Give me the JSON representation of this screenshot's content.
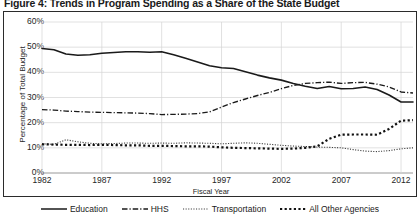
{
  "chart_data": {
    "type": "line",
    "title": "Figure 4: Trends in Program Spending as a Share of the State Budget",
    "xlabel": "Fiscal Year",
    "ylabel": "Percentage of Total Budget",
    "ylim": [
      0,
      60
    ],
    "xlim": [
      1982,
      2013
    ],
    "ytick_labels": [
      "0%",
      "10%",
      "20%",
      "30%",
      "40%",
      "50%",
      "60%"
    ],
    "ytick_values": [
      0,
      10,
      20,
      30,
      40,
      50,
      60
    ],
    "xtick_labels": [
      "1982",
      "1987",
      "1992",
      "1997",
      "2002",
      "2007",
      "2012"
    ],
    "xtick_values": [
      1982,
      1987,
      1992,
      1997,
      2002,
      2007,
      2012
    ],
    "grid": true,
    "legend_position": "bottom",
    "x": [
      1982,
      1983,
      1984,
      1985,
      1986,
      1987,
      1988,
      1989,
      1990,
      1991,
      1992,
      1993,
      1994,
      1995,
      1996,
      1997,
      1998,
      1999,
      2000,
      2001,
      2002,
      2003,
      2004,
      2005,
      2006,
      2007,
      2008,
      2009,
      2010,
      2011,
      2012,
      2013
    ],
    "series": [
      {
        "name": "Education",
        "style": "solid",
        "color": "#1a1a1a",
        "values": [
          49.5,
          49.0,
          47.3,
          46.8,
          47.0,
          47.6,
          47.9,
          48.2,
          48.2,
          48.0,
          48.2,
          47.0,
          45.6,
          44.1,
          42.6,
          41.8,
          41.5,
          40.2,
          38.9,
          37.8,
          36.9,
          35.6,
          34.5,
          33.6,
          34.4,
          33.5,
          33.6,
          34.2,
          33.2,
          31.0,
          28.2,
          28.2
        ]
      },
      {
        "name": "HHS",
        "style": "dashdot",
        "color": "#1a1a1a",
        "values": [
          25.2,
          25.0,
          24.6,
          24.4,
          24.2,
          24.1,
          24.0,
          23.9,
          23.8,
          23.6,
          23.2,
          23.3,
          23.4,
          23.6,
          24.3,
          26.2,
          28.0,
          29.4,
          30.8,
          32.0,
          33.5,
          34.8,
          35.6,
          35.9,
          36.1,
          35.6,
          35.9,
          36.0,
          35.3,
          34.2,
          32.2,
          31.8
        ]
      },
      {
        "name": "Transportation",
        "style": "dotted-fine",
        "color": "#3a3a3a",
        "values": [
          11.6,
          11.4,
          13.2,
          12.4,
          11.8,
          11.6,
          11.7,
          11.9,
          11.9,
          11.8,
          11.9,
          11.8,
          12.0,
          11.9,
          11.8,
          11.6,
          11.8,
          12.0,
          11.8,
          11.4,
          11.0,
          10.7,
          10.5,
          10.3,
          10.2,
          10.0,
          9.3,
          8.7,
          8.5,
          8.9,
          9.6,
          10.0
        ]
      },
      {
        "name": "All Other Agencies",
        "style": "dotted-bold",
        "color": "#111111",
        "values": [
          11.4,
          11.3,
          11.2,
          11.2,
          11.1,
          11.2,
          11.1,
          11.0,
          11.0,
          10.8,
          10.8,
          10.7,
          10.6,
          10.6,
          10.5,
          10.2,
          10.0,
          9.9,
          9.8,
          9.7,
          9.6,
          9.7,
          10.0,
          10.6,
          13.6,
          15.2,
          15.3,
          15.3,
          15.2,
          17.5,
          20.8,
          21.0
        ]
      }
    ]
  },
  "legend": {
    "items": [
      {
        "label": "Education"
      },
      {
        "label": "HHS"
      },
      {
        "label": "Transportation"
      },
      {
        "label": "All Other Agencies"
      }
    ]
  }
}
